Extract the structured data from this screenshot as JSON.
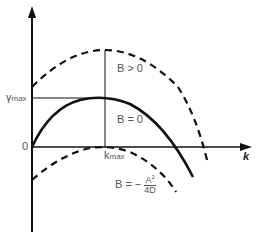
{
  "diagram": {
    "axes": {
      "x_label": "k",
      "origin_label": "0",
      "y_tick_label_main": "γ",
      "y_tick_label_sub": "max",
      "x_tick_label_main": "k",
      "x_tick_label_sub": "max"
    },
    "curves": [
      {
        "name": "B > 0",
        "style": "dashed",
        "label": "B > 0"
      },
      {
        "name": "B = 0",
        "style": "solid",
        "label": "B = 0"
      },
      {
        "name": "B = -A^2/4D",
        "style": "dashed",
        "label_prefix": "B = −",
        "label_num": "A",
        "label_num_sup": "2",
        "label_den": "4D"
      }
    ],
    "colors": {
      "line": "#111111",
      "text": "#555555"
    }
  }
}
